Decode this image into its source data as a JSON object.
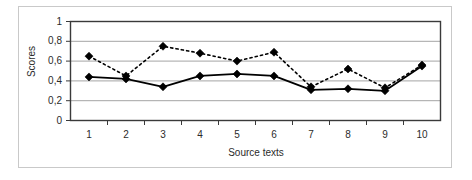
{
  "chart_data": {
    "type": "line",
    "title": "",
    "subtitle": "",
    "xlabel": "Source texts",
    "ylabel": "Scores",
    "categories": [
      "1",
      "2",
      "3",
      "4",
      "5",
      "6",
      "7",
      "8",
      "9",
      "10"
    ],
    "x": [
      1,
      2,
      3,
      4,
      5,
      6,
      7,
      8,
      9,
      10
    ],
    "ylim": [
      0,
      1
    ],
    "xlim": [
      0.5,
      10.5
    ],
    "ytick_labels": [
      "1",
      "0,8",
      "0,6",
      "0,4",
      "0,2",
      "0"
    ],
    "ytick_values": [
      1,
      0.8,
      0.6,
      0.4,
      0.2,
      0
    ],
    "xtick_labels": [
      "1",
      "2",
      "3",
      "4",
      "5",
      "6",
      "7",
      "8",
      "9",
      "10"
    ],
    "grid": "horizontal",
    "legend": "none",
    "series": [
      {
        "name": "dotted-series",
        "style": "dotted",
        "marker": "diamond",
        "color": "#000000",
        "values": [
          0.65,
          0.45,
          0.75,
          0.68,
          0.6,
          0.69,
          0.34,
          0.52,
          0.33,
          0.56
        ]
      },
      {
        "name": "solid-series",
        "style": "solid",
        "marker": "diamond",
        "color": "#000000",
        "values": [
          0.44,
          0.42,
          0.34,
          0.45,
          0.47,
          0.45,
          0.31,
          0.32,
          0.3,
          0.55
        ]
      }
    ]
  },
  "axes": {
    "y_title": "Scores",
    "x_title": "Source texts"
  },
  "colors": {
    "plot_border": "#3a3a3a",
    "gridline": "#9a9a9a",
    "series_ink": "#000000",
    "frame": "#c9c9c9",
    "background": "#ffffff"
  }
}
